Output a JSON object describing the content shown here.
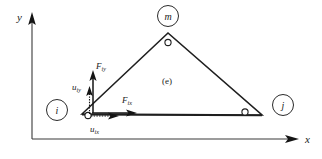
{
  "figure": {
    "caption_internal": "(e)",
    "background_color": "#ffffff",
    "line_color": "#1f1f1f"
  },
  "axes": {
    "x_label": "x",
    "y_label": "y",
    "origin_note": ""
  },
  "nodes": [
    {
      "id": "i",
      "tag_label": "i",
      "position": "bottom-left"
    },
    {
      "id": "j",
      "tag_label": "j",
      "position": "bottom-right"
    },
    {
      "id": "m",
      "tag_label": "m",
      "position": "apex"
    }
  ],
  "element": {
    "label": "(e)",
    "shape": "triangle"
  },
  "vectors": {
    "force_x": {
      "base": "F",
      "sub": "ix",
      "direction": "right"
    },
    "force_y": {
      "base": "F",
      "sub": "iy",
      "direction": "up"
    },
    "disp_x": {
      "base": "u",
      "sub": "ix",
      "direction": "right"
    },
    "disp_y": {
      "base": "u",
      "sub": "iy",
      "direction": "up"
    }
  }
}
